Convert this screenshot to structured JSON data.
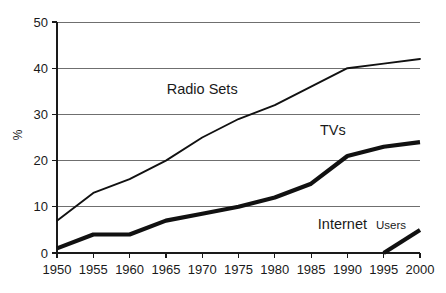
{
  "chart_data": {
    "type": "line",
    "title": "",
    "subtitle": "",
    "xlabel": "",
    "ylabel": "%",
    "x": [
      1950,
      1955,
      1960,
      1965,
      1970,
      1975,
      1980,
      1985,
      1990,
      1995,
      2000
    ],
    "categories": [
      "1950",
      "1955",
      "1960",
      "1965",
      "1970",
      "1975",
      "1980",
      "1985",
      "1990",
      "1995",
      "2000"
    ],
    "xlim": [
      1950,
      2000
    ],
    "ylim": [
      0,
      50
    ],
    "yticks": [
      0,
      10,
      20,
      30,
      40,
      50
    ],
    "yticklabels": [
      "0",
      "10",
      "20",
      "30",
      "40",
      "50"
    ],
    "grid": "horizontal",
    "legend": "inline-annotations",
    "series": [
      {
        "name": "Radio Sets",
        "style": "thin",
        "color": "#111111",
        "x": [
          1950,
          1955,
          1960,
          1965,
          1970,
          1975,
          1980,
          1985,
          1990,
          1995,
          2000
        ],
        "values": [
          7,
          13,
          16,
          20,
          25,
          29,
          32,
          36,
          40,
          41,
          42
        ]
      },
      {
        "name": "TVs",
        "style": "thick",
        "color": "#111111",
        "x": [
          1950,
          1955,
          1960,
          1965,
          1970,
          1975,
          1980,
          1985,
          1990,
          1995,
          2000
        ],
        "values": [
          1,
          4,
          4,
          7,
          8.5,
          10,
          12,
          15,
          21,
          23,
          24
        ]
      },
      {
        "name": "Internet Users",
        "style": "thick",
        "color": "#111111",
        "x": [
          1995,
          2000
        ],
        "values": [
          0,
          5
        ]
      }
    ],
    "annotations": [
      {
        "text": "Radio Sets",
        "x": 1970,
        "y": 34.5
      },
      {
        "text": "TVs",
        "x": 1988,
        "y": 25.5
      },
      {
        "text": "Internet",
        "x": 1992,
        "y": 5.3,
        "suffix": "Users"
      }
    ]
  },
  "labels": {
    "radio_sets": "Radio Sets",
    "tvs": "TVs",
    "internet_primary": "Internet",
    "internet_secondary": "Users",
    "y_axis_title": "%"
  }
}
